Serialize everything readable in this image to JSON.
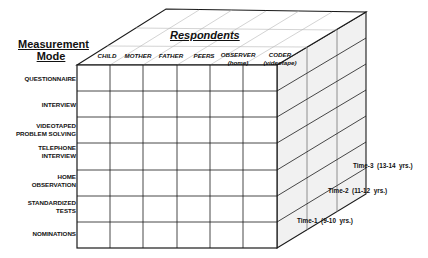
{
  "diagram": {
    "type": "3d-cube-matrix",
    "axes": {
      "measurement_mode": {
        "title_line1": "Measurement",
        "title_line2": "Mode",
        "items": [
          {
            "line1": "QUESTIONNAIRE",
            "line2": ""
          },
          {
            "line1": "INTERVIEW",
            "line2": ""
          },
          {
            "line1": "VIDEOTAPED",
            "line2": "PROBLEM SOLVING"
          },
          {
            "line1": "TELEPHONE",
            "line2": "INTERVIEW"
          },
          {
            "line1": "HOME",
            "line2": "OBSERVATION"
          },
          {
            "line1": "STANDARDIZED",
            "line2": "TESTS"
          },
          {
            "line1": "NOMINATIONS",
            "line2": ""
          }
        ]
      },
      "respondents": {
        "title": "Respondents",
        "items": [
          {
            "line1": "CHILD",
            "line2": ""
          },
          {
            "line1": "MOTHER",
            "line2": ""
          },
          {
            "line1": "FATHER",
            "line2": ""
          },
          {
            "line1": "PEERS",
            "line2": ""
          },
          {
            "line1": "OBSERVER",
            "line2": "(home)"
          },
          {
            "line1": "CODER",
            "line2": "(videotape)"
          }
        ]
      },
      "time": {
        "items": [
          {
            "label": "Time-1  (9-10  yrs.)"
          },
          {
            "label": "Time-2  (11-12  yrs.)"
          },
          {
            "label": "Time-3  (13-14  yrs.)"
          }
        ]
      }
    },
    "colors": {
      "line": "#1a1a1a",
      "top_grid": "#b5b5b5",
      "side_fill": "#f1f1f1",
      "front_fill": "#ffffff"
    }
  }
}
